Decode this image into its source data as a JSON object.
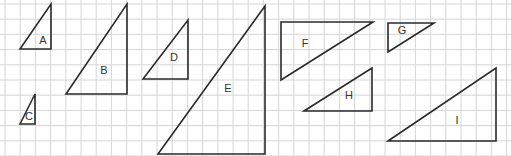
{
  "diagram": {
    "width": 511,
    "height": 156,
    "grid": {
      "origin_x": 5,
      "origin_y": 4,
      "spacing": 15.2,
      "color": "#d6d6d6"
    },
    "stroke_color": "#2a2a2a",
    "triangles": [
      {
        "label": "A",
        "points": [
          [
            20,
            49
          ],
          [
            51,
            4
          ],
          [
            51,
            49
          ]
        ],
        "label_pos": [
          43,
          41
        ]
      },
      {
        "label": "B",
        "points": [
          [
            66,
            94
          ],
          [
            127,
            4
          ],
          [
            127,
            94
          ]
        ],
        "label_pos": [
          104,
          71
        ]
      },
      {
        "label": "C",
        "points": [
          [
            20,
            124
          ],
          [
            35,
            94
          ],
          [
            35,
            124
          ]
        ],
        "label_pos": [
          29,
          117
        ]
      },
      {
        "label": "D",
        "points": [
          [
            143,
            79
          ],
          [
            188,
            20
          ],
          [
            188,
            79
          ]
        ],
        "label_pos": [
          174,
          58
        ]
      },
      {
        "label": "E",
        "points": [
          [
            158,
            154
          ],
          [
            265,
            6
          ],
          [
            265,
            154
          ]
        ],
        "label_pos": [
          228,
          89
        ]
      },
      {
        "label": "F",
        "points": [
          [
            281,
            22
          ],
          [
            373,
            22
          ],
          [
            281,
            80
          ]
        ],
        "label_pos": [
          305,
          44
        ]
      },
      {
        "label": "G",
        "points": [
          [
            388,
            23
          ],
          [
            434,
            23
          ],
          [
            388,
            52
          ]
        ],
        "label_pos": [
          402,
          31
        ]
      },
      {
        "label": "H",
        "points": [
          [
            304,
            111
          ],
          [
            372,
            68
          ],
          [
            372,
            111
          ]
        ],
        "label_pos": [
          349,
          96
        ]
      },
      {
        "label": "I",
        "points": [
          [
            388,
            141
          ],
          [
            496,
            68
          ],
          [
            496,
            141
          ]
        ],
        "label_pos": [
          457,
          121
        ]
      }
    ]
  }
}
